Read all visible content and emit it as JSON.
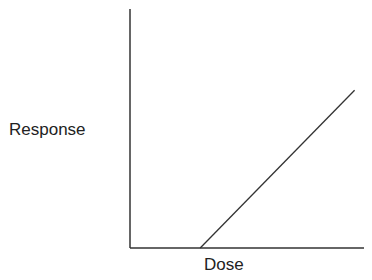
{
  "chart_data": {
    "type": "line",
    "title": "",
    "xlabel": "Dose",
    "ylabel": "Response",
    "grid": false,
    "legend": null,
    "ticks": {
      "x": [],
      "y": []
    },
    "xlim": [
      0,
      1
    ],
    "ylim": [
      0,
      1
    ],
    "series": [
      {
        "name": "dose-response",
        "x": [
          0.3,
          0.96
        ],
        "y": [
          0.0,
          0.66
        ]
      }
    ],
    "annotations": [
      "Threshold dose-response: no response until threshold dose, then linear increase"
    ],
    "colors": {
      "axis": "#333333",
      "line": "#333333",
      "background": "#ffffff"
    }
  }
}
